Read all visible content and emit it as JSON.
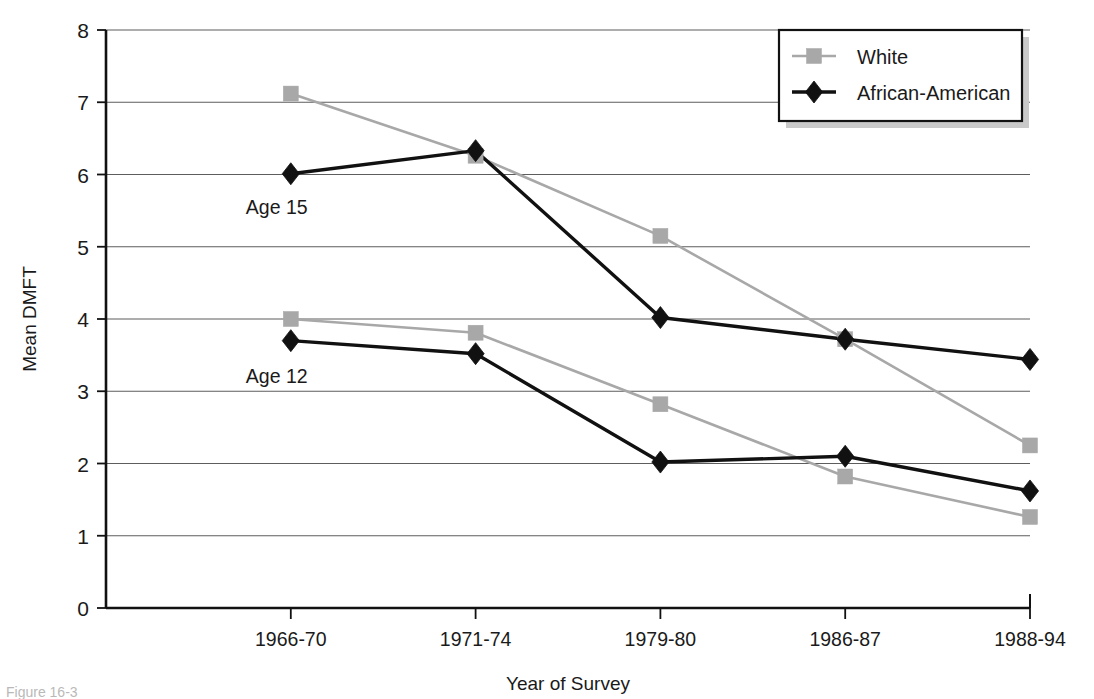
{
  "figure": {
    "background_color": "#ffffff",
    "caption_partial": "Figure 16-3"
  },
  "chart_data": {
    "type": "line",
    "title": "",
    "xlabel": "Year of Survey",
    "ylabel": "Mean DMFT",
    "categories": [
      "1966-70",
      "1971-74",
      "1979-80",
      "1986-87",
      "1988-94"
    ],
    "ylim": [
      0,
      8
    ],
    "ytick_labels": [
      "0",
      "1",
      "2",
      "3",
      "4",
      "5",
      "6",
      "7",
      "8"
    ],
    "ytick_values": [
      0,
      1,
      2,
      3,
      4,
      5,
      6,
      7,
      8
    ],
    "grid": "horizontal",
    "legend_position": "top-right",
    "groups": [
      {
        "annotation": "Age 15",
        "series": [
          {
            "name": "White",
            "marker": "square",
            "color": "#a8a8a8",
            "values": [
              7.12,
              6.26,
              5.15,
              3.72,
              2.25
            ]
          },
          {
            "name": "African-American",
            "marker": "diamond",
            "color": "#111111",
            "values": [
              6.01,
              6.33,
              4.02,
              3.72,
              3.44
            ]
          }
        ]
      },
      {
        "annotation": "Age 12",
        "series": [
          {
            "name": "White",
            "marker": "square",
            "color": "#a8a8a8",
            "values": [
              4.0,
              3.81,
              2.82,
              1.82,
              1.26
            ]
          },
          {
            "name": "African-American",
            "marker": "diamond",
            "color": "#111111",
            "values": [
              3.7,
              3.52,
              2.02,
              2.1,
              1.62
            ]
          }
        ]
      }
    ],
    "legend": [
      {
        "label": "White",
        "marker": "square",
        "color": "#a8a8a8"
      },
      {
        "label": "African-American",
        "marker": "diamond",
        "color": "#111111"
      }
    ],
    "annotations": [
      {
        "text": "Age 15",
        "x_category_index": 0,
        "y_value": 5.45
      },
      {
        "text": "Age 12",
        "x_category_index": 0,
        "y_value": 3.12
      }
    ]
  }
}
